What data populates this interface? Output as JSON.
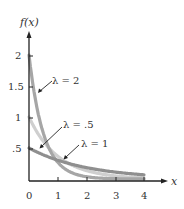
{
  "chart_data": {
    "type": "line",
    "title": "",
    "xlabel": "x",
    "ylabel": "f(x)",
    "xlim": [
      0,
      4.5
    ],
    "ylim": [
      0,
      2.3
    ],
    "grid": false,
    "x_ticks": [
      "0",
      "1",
      "2",
      "3",
      "4"
    ],
    "y_ticks": [
      ".5",
      "1",
      "1.5",
      "2"
    ],
    "function": "f(x) = λ e^(-λx)",
    "series": [
      {
        "name": "λ = 2",
        "label": "λ = 2",
        "lambda": 2,
        "color": "#a6a6a6",
        "x": [
          0,
          0.25,
          0.5,
          1,
          1.5,
          2
        ],
        "values": [
          2.0,
          1.21,
          0.74,
          0.27,
          0.1,
          0.04
        ]
      },
      {
        "name": "λ = 1",
        "label": "λ = 1",
        "lambda": 1,
        "color": "#cfcfcf",
        "x": [
          0,
          0.5,
          1,
          2,
          3,
          4
        ],
        "values": [
          1.0,
          0.61,
          0.37,
          0.14,
          0.05,
          0.02
        ]
      },
      {
        "name": "λ = .5",
        "label": "λ = .5",
        "lambda": 0.5,
        "color": "#8f8f8f",
        "x": [
          0,
          1,
          2,
          3,
          4
        ],
        "values": [
          0.5,
          0.3,
          0.18,
          0.11,
          0.07
        ]
      }
    ],
    "annotations": [
      {
        "text": "λ = 2",
        "points_to": "λ = 2 curve near x≈0.3"
      },
      {
        "text": "λ = .5",
        "points_to": "λ = .5 curve near x≈0.25"
      },
      {
        "text": "λ = 1",
        "points_to": "λ = 1 curve near x≈1.2"
      }
    ]
  },
  "labels": {
    "y_axis": "f(x)",
    "x_axis": "x",
    "x_ticks": [
      "0",
      "1",
      "2",
      "3",
      "4"
    ],
    "y_ticks": [
      ".5",
      "1",
      "1.5",
      "2"
    ],
    "lambda2": "λ = 2",
    "lambda05": "λ = .5",
    "lambda1": "λ = 1"
  }
}
